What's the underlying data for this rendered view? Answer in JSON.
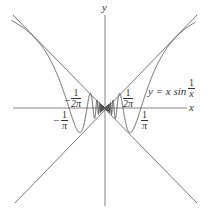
{
  "chart_data": {
    "type": "line",
    "title": "",
    "xlabel": "x",
    "ylabel": "y",
    "function_label": "y = x sin 1/x",
    "series": [
      {
        "name": "y = x sin(1/x)",
        "expr": "x*sin(1/x)"
      },
      {
        "name": "y = x",
        "expr": "x"
      },
      {
        "name": "y = -x",
        "expr": "-x"
      }
    ],
    "xlim": [
      -0.83,
      0.8
    ],
    "ylim": [
      -0.85,
      0.82
    ],
    "annotations": [
      "1/(2π)",
      "1/π",
      "-1/(2π)",
      "-1/π"
    ],
    "grid": false
  },
  "labels": {
    "x_axis": "x",
    "y_axis": "y",
    "func_prefix": "y = x sin",
    "func_num": "1",
    "func_den": "x",
    "pos_half_num": "1",
    "pos_half_den": "2π",
    "neg_half_num": "1",
    "neg_half_den": "2π",
    "neg_half_sign": "−",
    "pos_pi_num": "1",
    "pos_pi_den": "π",
    "neg_pi_num": "1",
    "neg_pi_den": "π",
    "neg_pi_sign": "−"
  }
}
